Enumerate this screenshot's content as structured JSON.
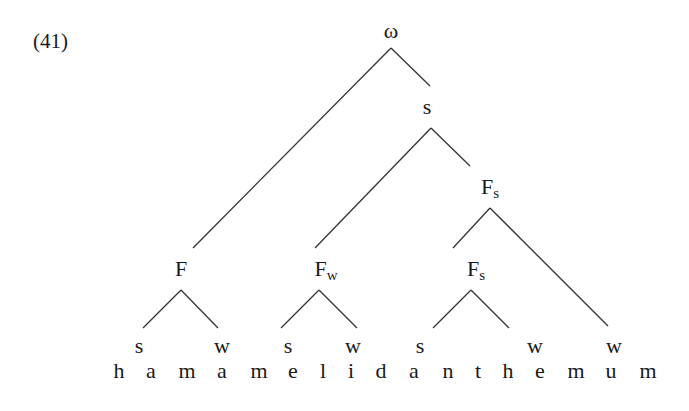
{
  "example_number": "(41)",
  "nodes": {
    "root": "ω",
    "s_top": "s",
    "F1": "F",
    "Fw_main": "F",
    "Fw_sub": "w",
    "Fs_upper_main": "F",
    "Fs_upper_sub": "s",
    "Fs_lower_main": "F",
    "Fs_lower_sub": "s"
  },
  "leaves": [
    "s",
    "w",
    "s",
    "w",
    "s",
    "w",
    "w"
  ],
  "word": {
    "text": "hamamelidanthemum",
    "letters": [
      "h",
      "a",
      "m",
      "a",
      "m",
      "e",
      "l",
      "i",
      "d",
      "a",
      "n",
      "t",
      "h",
      "e",
      "m",
      "u",
      "m"
    ]
  },
  "line_color": "#333333"
}
